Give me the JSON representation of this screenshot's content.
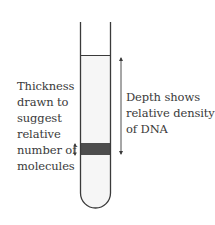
{
  "diagram": {
    "tube": {
      "liquid_fill_color": "#f6f6f6",
      "band_color": "#4d4d4d",
      "outline_color": "#3a3a3a"
    },
    "left_label": {
      "lines": [
        "Thickness",
        "drawn to",
        "suggest",
        "relative",
        "number of",
        "molecules"
      ]
    },
    "right_label": {
      "lines": [
        "Depth shows",
        "relative density",
        "of DNA"
      ]
    },
    "icons": {
      "thickness_arrow": "double-headed-vertical-arrow",
      "depth_arrow": "double-headed-vertical-arrow"
    }
  }
}
